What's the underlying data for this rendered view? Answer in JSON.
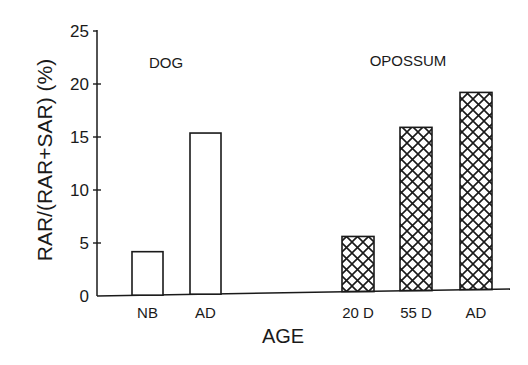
{
  "chart_data": {
    "type": "bar",
    "title": "",
    "xlabel": "AGE",
    "ylabel": "RAR/(RAR+SAR) (%)",
    "ylim": [
      0,
      25
    ],
    "yticks": [
      0,
      5,
      10,
      15,
      20,
      25
    ],
    "grid": false,
    "groups": [
      {
        "name": "DOG",
        "fill": "open",
        "categories": [
          "NB",
          "AD"
        ],
        "values": [
          4.1,
          15.2
        ]
      },
      {
        "name": "OPOSSUM",
        "fill": "crosshatch",
        "categories": [
          "20 D",
          "55 D",
          "AD"
        ],
        "values": [
          5.2,
          15.4,
          18.6
        ]
      }
    ]
  },
  "colors": {
    "ink": "#1a1a1a",
    "background": "#ffffff"
  }
}
